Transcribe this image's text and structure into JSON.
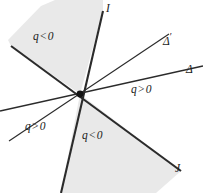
{
  "figure": {
    "background_color": "#ffffff",
    "shade_color": "#e9e9e9",
    "line_color": "#2b2b2b",
    "origin": {
      "x": 80,
      "y": 94,
      "label": "origin-point"
    },
    "lines": [
      {
        "id": "I",
        "name": "line-I",
        "label": "I",
        "weight": "thick",
        "x1": 103,
        "y1": 11,
        "x2": 61,
        "y2": 193,
        "label_x": 106,
        "label_y": 9
      },
      {
        "id": "Delta-prime",
        "name": "line-delta-prime",
        "label": "Δ",
        "label_suffix": "′",
        "weight": "thin",
        "x1": 9,
        "y1": 141,
        "x2": 169,
        "y2": 34,
        "label_x": 166,
        "label_y": 37
      },
      {
        "id": "Delta",
        "name": "line-delta",
        "label": "Δ",
        "label_suffix": "",
        "weight": "medium",
        "x1": 0,
        "y1": 111,
        "x2": 203,
        "y2": 66,
        "label_x": 186,
        "label_y": 70
      },
      {
        "id": "J",
        "name": "line-J",
        "label": "J",
        "weight": "thick",
        "x1": 11,
        "y1": 46,
        "x2": 181,
        "y2": 171,
        "label_x": 178,
        "label_y": 168
      }
    ],
    "shaded_regions": [
      {
        "name": "region-top-left-negative",
        "label": "q < 0",
        "sign": "negative",
        "polygon": "80,94 11,46 8,40 41,6 55,0 103,0 103,11",
        "label_x": 33,
        "label_y": 37
      },
      {
        "name": "region-bottom-negative",
        "label": "q < 0",
        "sign": "positive-boundary",
        "polygon": "80,94 181,171 156,193 64,193 61,193",
        "label_x": 82,
        "label_y": 136
      }
    ],
    "region_labels": [
      {
        "name": "region-label-top-left",
        "q": "q",
        "op": "<",
        "value": "0",
        "text": "q < 0",
        "x": 33,
        "y": 37
      },
      {
        "name": "region-label-right",
        "q": "q",
        "op": ">",
        "value": "0",
        "text": "q > 0",
        "x": 131,
        "y": 90
      },
      {
        "name": "region-label-bottom-left",
        "q": "q",
        "op": ">",
        "value": "0",
        "text": "q > 0",
        "x": 25,
        "y": 127
      },
      {
        "name": "region-label-bottom",
        "q": "q",
        "op": "<",
        "value": "0",
        "text": "q < 0",
        "x": 82,
        "y": 136
      }
    ]
  }
}
